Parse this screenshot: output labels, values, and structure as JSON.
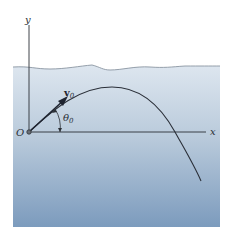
{
  "figure": {
    "labels": {
      "y_axis": "y",
      "x_axis": "x",
      "origin": "O",
      "velocity": "v",
      "velocity_sub": "0",
      "angle": "θ",
      "angle_sub": "0"
    },
    "colors": {
      "fluid_top": "#dce5ee",
      "fluid_mid": "#b4c6d9",
      "fluid_bottom": "#7f9dbf",
      "surface_line": "#8a95a2",
      "axis": "#2b2f35",
      "trajectory": "#2a2f38",
      "background": "#ffffff"
    }
  }
}
